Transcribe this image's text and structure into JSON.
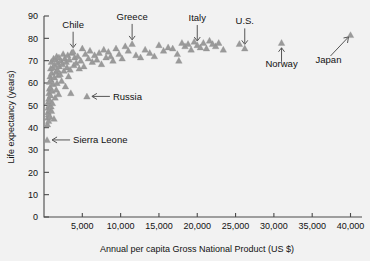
{
  "chart_data": {
    "type": "scatter",
    "title": "",
    "xlabel": "Annual per capita Gross National Product (US $)",
    "ylabel": "Life expectancy (years)",
    "xlim": [
      0,
      41500
    ],
    "ylim": [
      0,
      90
    ],
    "xticks": [
      5000,
      10000,
      15000,
      20000,
      25000,
      30000,
      35000,
      40000
    ],
    "xtick_labels": [
      "5,000",
      "10,000",
      "15,000",
      "20,000",
      "25,000",
      "30,000",
      "35,000",
      "40,000"
    ],
    "yticks": [
      0,
      10,
      20,
      30,
      40,
      50,
      60,
      70,
      80,
      90
    ],
    "ytick_labels": [
      "0",
      "10",
      "20",
      "30",
      "40",
      "50",
      "60",
      "70",
      "80",
      "90"
    ],
    "grid": false,
    "legend": false,
    "marker": "triangle-up",
    "marker_color": "#9a9a9a",
    "points": [
      [
        400,
        34.5
      ],
      [
        450,
        41.5
      ],
      [
        500,
        44.5
      ],
      [
        520,
        47.0
      ],
      [
        540,
        49.0
      ],
      [
        560,
        51.5
      ],
      [
        580,
        46.0
      ],
      [
        600,
        43.0
      ],
      [
        620,
        53.0
      ],
      [
        650,
        55.5
      ],
      [
        670,
        50.0
      ],
      [
        700,
        48.0
      ],
      [
        720,
        57.5
      ],
      [
        740,
        60.5
      ],
      [
        760,
        52.0
      ],
      [
        780,
        45.0
      ],
      [
        800,
        63.0
      ],
      [
        820,
        58.0
      ],
      [
        850,
        54.5
      ],
      [
        870,
        66.5
      ],
      [
        900,
        61.5
      ],
      [
        920,
        49.5
      ],
      [
        950,
        69.5
      ],
      [
        980,
        47.5
      ],
      [
        1000,
        64.5
      ],
      [
        1050,
        56.5
      ],
      [
        1100,
        51.0
      ],
      [
        1150,
        67.0
      ],
      [
        1200,
        59.5
      ],
      [
        1250,
        71.0
      ],
      [
        1300,
        44.0
      ],
      [
        1350,
        62.5
      ],
      [
        1400,
        68.0
      ],
      [
        1450,
        53.5
      ],
      [
        1500,
        70.5
      ],
      [
        1550,
        65.0
      ],
      [
        1600,
        57.0
      ],
      [
        1650,
        72.0
      ],
      [
        1700,
        60.0
      ],
      [
        1750,
        66.0
      ],
      [
        1800,
        69.0
      ],
      [
        1850,
        63.5
      ],
      [
        1900,
        55.0
      ],
      [
        1950,
        71.5
      ],
      [
        2000,
        67.5
      ],
      [
        2100,
        64.0
      ],
      [
        2200,
        70.0
      ],
      [
        2300,
        61.0
      ],
      [
        2400,
        68.5
      ],
      [
        2500,
        73.0
      ],
      [
        2600,
        65.5
      ],
      [
        2700,
        71.0
      ],
      [
        2800,
        58.5
      ],
      [
        2900,
        69.5
      ],
      [
        3000,
        67.0
      ],
      [
        3100,
        72.5
      ],
      [
        3200,
        63.0
      ],
      [
        3300,
        70.5
      ],
      [
        3400,
        66.0
      ],
      [
        3500,
        55.5
      ],
      [
        3600,
        73.5
      ],
      [
        3800,
        74.0
      ],
      [
        3900,
        68.0
      ],
      [
        4000,
        71.5
      ],
      [
        4200,
        69.0
      ],
      [
        4400,
        72.0
      ],
      [
        4600,
        66.5
      ],
      [
        4800,
        70.0
      ],
      [
        5000,
        75.5
      ],
      [
        5200,
        67.5
      ],
      [
        5400,
        73.0
      ],
      [
        5600,
        54.0
      ],
      [
        5800,
        71.0
      ],
      [
        6000,
        74.5
      ],
      [
        6300,
        69.5
      ],
      [
        6600,
        72.5
      ],
      [
        6900,
        70.5
      ],
      [
        7200,
        73.5
      ],
      [
        7500,
        68.5
      ],
      [
        7800,
        75.0
      ],
      [
        8100,
        71.5
      ],
      [
        8400,
        74.0
      ],
      [
        8700,
        72.0
      ],
      [
        9000,
        70.0
      ],
      [
        9400,
        75.5
      ],
      [
        9800,
        73.0
      ],
      [
        10200,
        71.0
      ],
      [
        10600,
        76.5
      ],
      [
        11000,
        74.5
      ],
      [
        11500,
        77.5
      ],
      [
        12000,
        72.5
      ],
      [
        12600,
        71.5
      ],
      [
        13200,
        75.0
      ],
      [
        13800,
        73.5
      ],
      [
        14400,
        72.0
      ],
      [
        15000,
        77.0
      ],
      [
        15600,
        74.5
      ],
      [
        16200,
        76.0
      ],
      [
        16800,
        75.5
      ],
      [
        17400,
        73.0
      ],
      [
        17600,
        70.0
      ],
      [
        18000,
        78.0
      ],
      [
        18400,
        76.5
      ],
      [
        18800,
        77.5
      ],
      [
        19200,
        75.0
      ],
      [
        19600,
        78.5
      ],
      [
        20000,
        77.0
      ],
      [
        20400,
        76.0
      ],
      [
        20800,
        78.0
      ],
      [
        21200,
        75.5
      ],
      [
        21600,
        79.0
      ],
      [
        22000,
        77.5
      ],
      [
        22400,
        76.5
      ],
      [
        22800,
        78.0
      ],
      [
        23400,
        75.0
      ],
      [
        25500,
        77.5
      ],
      [
        26200,
        75.5
      ],
      [
        31000,
        78.0
      ],
      [
        40000,
        81.5
      ]
    ],
    "annotations": [
      {
        "label": "Chile",
        "value_x": 3800,
        "value_y": 74.0,
        "pointer": "down"
      },
      {
        "label": "Greece",
        "value_x": 11500,
        "value_y": 77.5,
        "pointer": "down"
      },
      {
        "label": "Italy",
        "value_x": 20000,
        "value_y": 77.0,
        "pointer": "down"
      },
      {
        "label": "U.S.",
        "value_x": 26200,
        "value_y": 75.5,
        "pointer": "down"
      },
      {
        "label": "Norway",
        "value_x": 31000,
        "value_y": 78.0,
        "pointer": "up"
      },
      {
        "label": "Japan",
        "value_x": 40000,
        "value_y": 81.5,
        "pointer": "diagonal"
      },
      {
        "label": "Russia",
        "value_x": 5600,
        "value_y": 54.0,
        "pointer": "left"
      },
      {
        "label": "Sierra Leone",
        "value_x": 400,
        "value_y": 34.5,
        "pointer": "left"
      }
    ]
  }
}
